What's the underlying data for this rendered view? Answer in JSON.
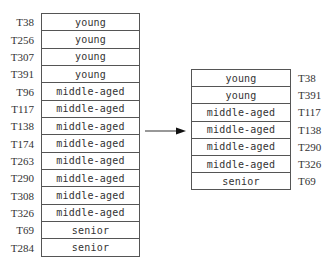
{
  "left_table": {
    "rows": [
      {
        "id": "T38",
        "value": "young"
      },
      {
        "id": "T256",
        "value": "young"
      },
      {
        "id": "T307",
        "value": "young"
      },
      {
        "id": "T391",
        "value": "young"
      },
      {
        "id": "T96",
        "value": "middle-aged"
      },
      {
        "id": "T117",
        "value": "middle-aged"
      },
      {
        "id": "T138",
        "value": "middle-aged"
      },
      {
        "id": "T174",
        "value": "middle-aged"
      },
      {
        "id": "T263",
        "value": "middle-aged"
      },
      {
        "id": "T290",
        "value": "middle-aged"
      },
      {
        "id": "T308",
        "value": "middle-aged"
      },
      {
        "id": "T326",
        "value": "middle-aged"
      },
      {
        "id": "T69",
        "value": "senior"
      },
      {
        "id": "T284",
        "value": "senior"
      }
    ]
  },
  "right_table": {
    "rows": [
      {
        "id": "T38",
        "value": "young"
      },
      {
        "id": "T391",
        "value": "young"
      },
      {
        "id": "T117",
        "value": "middle-aged"
      },
      {
        "id": "T138",
        "value": "middle-aged"
      },
      {
        "id": "T290",
        "value": "middle-aged"
      },
      {
        "id": "T326",
        "value": "middle-aged"
      },
      {
        "id": "T69",
        "value": "senior"
      }
    ]
  },
  "arrow": {
    "icon": "arrow-right-icon",
    "color": "#222222"
  }
}
